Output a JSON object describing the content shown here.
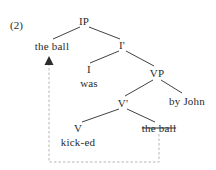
{
  "figure": {
    "example_number": "(2)",
    "ink_color": "#2b2b2b",
    "movement_line_color": "#b5b5b5",
    "background": "#ffffff"
  },
  "tree": {
    "nodes": [
      {
        "id": "ip",
        "label": "IP",
        "x": 84,
        "y": 21,
        "kind": "phrase-node"
      },
      {
        "id": "subject",
        "label": "the ball",
        "x": 52,
        "y": 46,
        "kind": "moved-constituent"
      },
      {
        "id": "ibar",
        "label": "I'",
        "x": 122,
        "y": 45,
        "kind": "bar-node"
      },
      {
        "id": "i-head",
        "label": "I",
        "x": 89,
        "y": 69,
        "kind": "head-node"
      },
      {
        "id": "i-word",
        "label": "was",
        "x": 89,
        "y": 83,
        "kind": "terminal-word"
      },
      {
        "id": "vp",
        "label": "VP",
        "x": 157,
        "y": 73,
        "kind": "phrase-node"
      },
      {
        "id": "vbar",
        "label": "V'",
        "x": 123,
        "y": 103,
        "kind": "bar-node"
      },
      {
        "id": "by-john",
        "label": "by John",
        "x": 187,
        "y": 101,
        "kind": "adjunct-phrase"
      },
      {
        "id": "v-head",
        "label": "V",
        "x": 78,
        "y": 128,
        "kind": "head-node"
      },
      {
        "id": "v-word",
        "label": "kick-ed",
        "x": 78,
        "y": 142,
        "kind": "terminal-word"
      },
      {
        "id": "trace",
        "label": "the ball",
        "x": 159,
        "y": 128,
        "kind": "trace-struck"
      }
    ],
    "branches": [
      {
        "from": "ip",
        "to": "subject",
        "x1": 80,
        "y1": 27,
        "x2": 53,
        "y2": 39
      },
      {
        "from": "ip",
        "to": "ibar",
        "x1": 89,
        "y1": 27,
        "x2": 120,
        "y2": 39
      },
      {
        "from": "ibar",
        "to": "i-head",
        "x1": 119,
        "y1": 51,
        "x2": 90,
        "y2": 63
      },
      {
        "from": "ibar",
        "to": "vp",
        "x1": 126,
        "y1": 51,
        "x2": 154,
        "y2": 66
      },
      {
        "from": "vp",
        "to": "vbar",
        "x1": 153,
        "y1": 80,
        "x2": 125,
        "y2": 96
      },
      {
        "from": "vp",
        "to": "by-john",
        "x1": 161,
        "y1": 80,
        "x2": 182,
        "y2": 93
      },
      {
        "from": "vbar",
        "to": "v-head",
        "x1": 119,
        "y1": 109,
        "x2": 82,
        "y2": 122
      },
      {
        "from": "vbar",
        "to": "trace",
        "x1": 127,
        "y1": 109,
        "x2": 155,
        "y2": 122
      }
    ],
    "movement_arrow": {
      "label": "movement-arrow",
      "description": "dashed line from trace position up to subject position",
      "path": [
        {
          "x": 159,
          "y": 134
        },
        {
          "x": 159,
          "y": 162
        },
        {
          "x": 49,
          "y": 162
        },
        {
          "x": 49,
          "y": 63
        }
      ],
      "arrowhead": {
        "x": 49,
        "y": 56,
        "width": 9,
        "height": 9,
        "direction": "up"
      }
    }
  }
}
